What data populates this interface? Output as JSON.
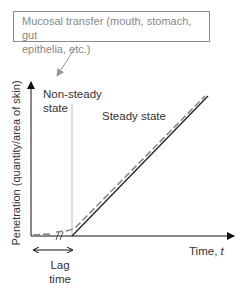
{
  "diagram": {
    "type": "penetration-vs-time",
    "callout": {
      "text_line1": "Mucosal transfer (mouth, stomach, gut",
      "text_line2": "epithelia, etc.)"
    },
    "regions": {
      "non_steady_line1": "Non-steady",
      "non_steady_line2": "state",
      "steady": "Steady state"
    },
    "axes": {
      "y_label": "Penetration (quantity/area of skin)",
      "x_label_prefix": "Time, ",
      "x_label_var": "t"
    },
    "lag": {
      "line1": "Lag",
      "line2": "time"
    },
    "colors": {
      "solid_line": "#222222",
      "dashed_line": "#888888",
      "box_border": "#8a8a8a",
      "divider": "#aaaaaa"
    }
  }
}
